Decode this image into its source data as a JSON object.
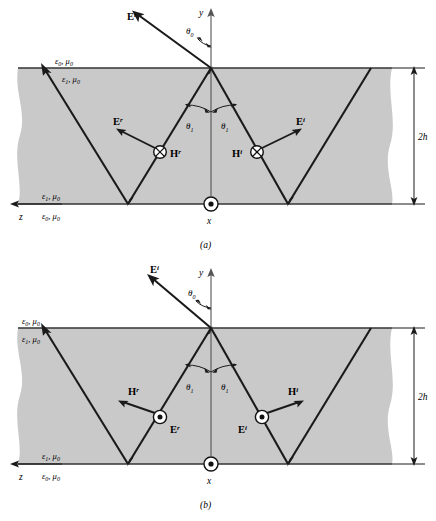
{
  "figure": {
    "colors": {
      "slab_fill": "#c9c9c9",
      "ray": "#1a1a1a",
      "boundary": "#333333",
      "background": "#ffffff"
    }
  },
  "panels": [
    {
      "id": "a",
      "caption": "(a)",
      "polarization": "E in plane of incidence; H out of page (into page, crossed circle)",
      "axes": {
        "y_label": "y",
        "x_label": "x",
        "z_label": "z",
        "x_symbol": "dot-circle",
        "x_symbol_meaning": "out-of-page"
      },
      "angles": {
        "theta0": "θ",
        "theta0_sub": "0",
        "theta1_left": "θ",
        "theta1_left_sub": "1",
        "theta1_right": "θ",
        "theta1_right_sub": "1"
      },
      "media": {
        "top_outside": {
          "eps": "ε",
          "eps_sub": "0",
          "mu": "μ",
          "mu_sub": "0"
        },
        "top_inside": {
          "eps": "ε",
          "eps_sub": "1",
          "mu": "μ",
          "mu_sub": "0"
        },
        "bottom_inside": {
          "eps": "ε",
          "eps_sub": "1",
          "mu": "μ",
          "mu_sub": "0"
        },
        "bottom_outside": {
          "eps": "ε",
          "eps_sub": "0",
          "mu": "μ",
          "mu_sub": "0"
        }
      },
      "dimension": {
        "value": "2",
        "italic_part": "h"
      },
      "field_labels": [
        {
          "name": "E-incident-top",
          "base": "E",
          "sup": "i",
          "symbol": "arrow"
        },
        {
          "name": "E-reflected",
          "base": "E",
          "sup": "r",
          "symbol": "arrow"
        },
        {
          "name": "H-reflected",
          "base": "H",
          "sup": "r",
          "symbol": "cross-circle"
        },
        {
          "name": "H-incident",
          "base": "H",
          "sup": "i",
          "symbol": "cross-circle"
        },
        {
          "name": "E-incident",
          "base": "E",
          "sup": "i",
          "symbol": "arrow"
        }
      ]
    },
    {
      "id": "b",
      "caption": "(b)",
      "polarization": "H in plane of incidence; E out of page (dot circle)",
      "axes": {
        "y_label": "y",
        "x_label": "x",
        "z_label": "z",
        "x_symbol": "dot-circle",
        "x_symbol_meaning": "out-of-page"
      },
      "angles": {
        "theta0": "θ",
        "theta0_sub": "0",
        "theta1_left": "θ",
        "theta1_left_sub": "1",
        "theta1_right": "θ",
        "theta1_right_sub": "1"
      },
      "media": {
        "top_outside": {
          "eps": "ε",
          "eps_sub": "0",
          "mu": "μ",
          "mu_sub": "0"
        },
        "top_inside": {
          "eps": "ε",
          "eps_sub": "1",
          "mu": "μ",
          "mu_sub": "0"
        },
        "bottom_inside": {
          "eps": "ε",
          "eps_sub": "1",
          "mu": "μ",
          "mu_sub": "0"
        },
        "bottom_outside": {
          "eps": "ε",
          "eps_sub": "0",
          "mu": "μ",
          "mu_sub": "0"
        }
      },
      "dimension": {
        "value": "2",
        "italic_part": "h"
      },
      "field_labels": [
        {
          "name": "E-incident-top",
          "base": "E",
          "sup": "i",
          "symbol": "arrow"
        },
        {
          "name": "H-reflected",
          "base": "H",
          "sup": "r",
          "symbol": "arrow"
        },
        {
          "name": "E-reflected",
          "base": "E",
          "sup": "r",
          "symbol": "dot-circle"
        },
        {
          "name": "E-incident",
          "base": "E",
          "sup": "i",
          "symbol": "dot-circle"
        },
        {
          "name": "H-incident",
          "base": "H",
          "sup": "i",
          "symbol": "arrow"
        }
      ]
    }
  ]
}
